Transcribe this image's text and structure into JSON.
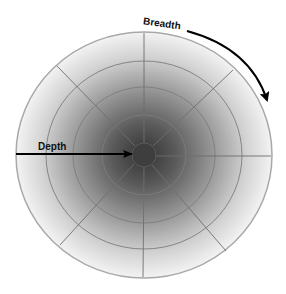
{
  "diagram": {
    "title": "",
    "labels": {
      "depth": "Depth",
      "breadth": "Breadth"
    },
    "structure": {
      "type": "polar-grid",
      "center": [
        144,
        155
      ],
      "outer_radius_x": 128,
      "outer_radius_y": 123,
      "ring_count": 4,
      "ring_fractions": [
        0.1,
        0.33,
        0.55,
        0.77,
        1.0
      ],
      "spoke_count": 8
    },
    "colors": {
      "center_shade": "#3a3a3a",
      "edge_shade": "#f4f4f4",
      "grid_line": "#7a7a7a",
      "outer_border": "#a8a8a8",
      "arrow": "#000000",
      "text": "#111111"
    },
    "arrows": [
      {
        "name": "depth-arrow",
        "direction": "edge-to-center",
        "label": "Depth"
      },
      {
        "name": "breadth-arrow",
        "direction": "clockwise-along-rim",
        "label": "Breadth"
      }
    ]
  }
}
